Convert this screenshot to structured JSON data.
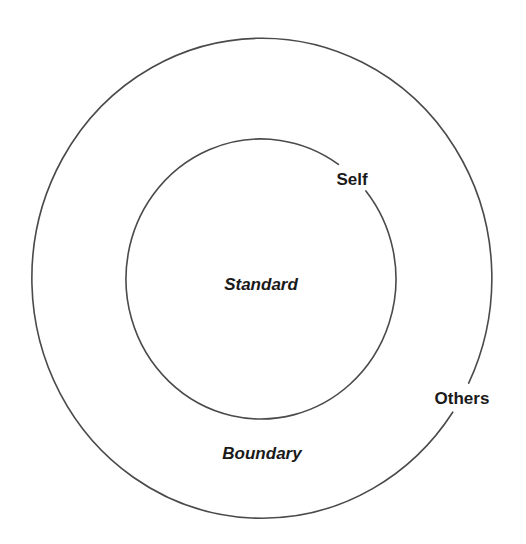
{
  "diagram": {
    "type": "concentric-circles",
    "stroke_color": "#4a4a4a",
    "background": "#ffffff",
    "inner_circle": {
      "center_label": "Standard",
      "edge_label": "Self"
    },
    "outer_circle": {
      "ring_label": "Boundary",
      "edge_label": "Others"
    }
  }
}
